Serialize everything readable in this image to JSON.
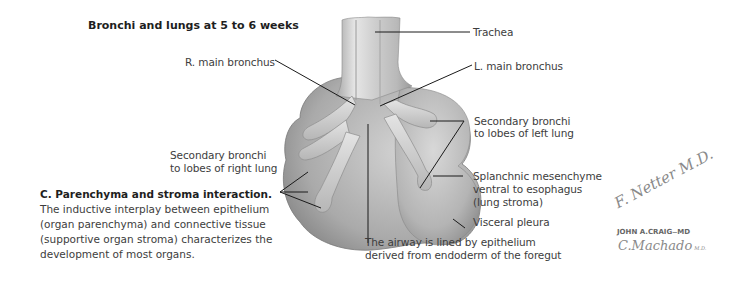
{
  "figure": {
    "title": "Bronchi and lungs at 5 to 6 weeks",
    "labels": {
      "trachea": "Trachea",
      "r_main_bronchus": "R. main bronchus",
      "l_main_bronchus": "L. main bronchus",
      "sec_left_1": "Secondary bronchi",
      "sec_left_2": "to lobes of left lung",
      "sec_right_1": "Secondary bronchi",
      "sec_right_2": "to lobes of right lung",
      "splanchnic_1": "Splanchnic mesenchyme",
      "splanchnic_2": "ventral to esophagus",
      "splanchnic_3": "(lung stroma)",
      "visceral_pleura": "Visceral pleura",
      "airway_1": "The airway is lined by epithelium",
      "airway_2": "derived from endoderm of the foregut"
    },
    "caption": {
      "heading": "C. Parenchyma and stroma interaction.",
      "body": " The inductive interplay between epithelium (organ parenchyma) and connective tissue (supportive organ stroma) characterizes the development of most organs."
    },
    "signatures": {
      "netter": "F. Netter M.D.",
      "craig": "JOHN A.CRAIG",
      "craig_suffix": "MD",
      "machado": "C.Machado",
      "machado_suffix": "M.D."
    }
  }
}
